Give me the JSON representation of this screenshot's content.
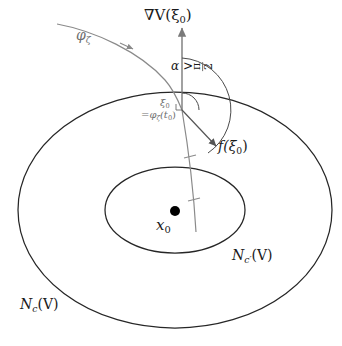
{
  "figure": {
    "type": "mathematical-diagram",
    "background_color": "#ffffff",
    "curve_color": "#262626",
    "vector_color": "#7a7a7a",
    "point_color": "#000000"
  },
  "labels": {
    "gradient_vector": "∇V(ξ0)",
    "gradient_base": "∇V(ξ",
    "gradient_sub": "0",
    "gradient_close": ")",
    "trajectory": "φζ",
    "trajectory_base": "φ",
    "trajectory_sub": "ζ",
    "angle_relation": "α > π/2",
    "angle_symbol": "α",
    "angle_operator": ">",
    "angle_numerator": "π",
    "angle_denominator": "2",
    "crossing_point": "ξ0",
    "crossing_point_base": "ξ",
    "crossing_point_sub": "0",
    "crossing_point_equation": "=φζ(t0)",
    "crossing_eq_prefix": "=φ",
    "crossing_eq_sub1": "ζ",
    "crossing_eq_mid": "(t",
    "crossing_eq_sub2": "0",
    "crossing_eq_close": ")",
    "vector_field": "f(ξ0)",
    "vector_field_base": "f(ξ",
    "vector_field_sub": "0",
    "vector_field_close": ")",
    "equilibrium_point": "x0",
    "equilibrium_base": "x",
    "equilibrium_sub": "0",
    "inner_level_set": "Nc'(V)",
    "inner_level_base": "N",
    "inner_level_sub": "c′",
    "inner_level_arg": "(V)",
    "outer_level_set": "Nc(V)",
    "outer_level_base": "N",
    "outer_level_sub": "c",
    "outer_level_arg": "(V)"
  },
  "geometry": {
    "outer_ellipse": {
      "cx": 175,
      "cy": 210,
      "rx": 157,
      "ry": 118
    },
    "inner_ellipse": {
      "cx": 175,
      "cy": 210,
      "rx": 70,
      "ry": 43
    },
    "equilibrium": {
      "x": 175,
      "y": 211,
      "r": 5
    },
    "crossing": {
      "x": 182,
      "y": 110
    },
    "gradient_arrow": {
      "x1": 182,
      "y1": 110,
      "x2": 182,
      "y2": 26
    },
    "vector_field_arrow": {
      "x1": 182,
      "y1": 110,
      "x2": 217,
      "y2": 147
    },
    "vertical_line": {
      "x1": 182,
      "y1": 110,
      "x2": 196,
      "y2": 232
    },
    "tick_marks": [
      {
        "x": 190,
        "y": 157
      },
      {
        "x": 194,
        "y": 200
      }
    ],
    "angle_arc_radius": 52,
    "small_arc_radius": 17
  }
}
